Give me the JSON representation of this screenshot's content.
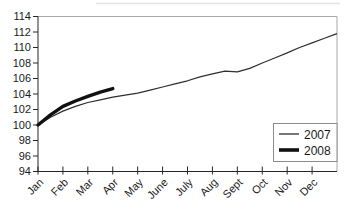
{
  "chart_data": {
    "type": "line",
    "title": "",
    "xlabel": "",
    "ylabel": "",
    "grid": false,
    "x_categories": [
      "Jan",
      "Feb",
      "Mar",
      "Apr",
      "May",
      "June",
      "July",
      "Aug",
      "Sept",
      "Oct",
      "Nov",
      "Dec"
    ],
    "y_tick_labels": [
      "114",
      "112",
      "110",
      "108",
      "106",
      "104",
      "102",
      "100",
      "98",
      "96",
      "94"
    ],
    "ylim": [
      94,
      114
    ],
    "ytick_step": 2,
    "legend_position": "bottom-right-inside",
    "series": [
      {
        "name": "2007",
        "line_style": "thin",
        "color": "#2e2e2e",
        "monthly_values": [
          100.0,
          101.8,
          102.9,
          103.6,
          104.1,
          104.9,
          105.7,
          106.6,
          106.9,
          108.0,
          109.3,
          110.6
        ],
        "year_end_value": 111.8,
        "samples": [
          [
            0,
            100.0
          ],
          [
            0.5,
            101.0
          ],
          [
            1,
            101.8
          ],
          [
            1.5,
            102.4
          ],
          [
            2,
            102.9
          ],
          [
            2.5,
            103.25
          ],
          [
            3,
            103.6
          ],
          [
            3.5,
            103.85
          ],
          [
            4,
            104.1
          ],
          [
            4.5,
            104.5
          ],
          [
            5,
            104.9
          ],
          [
            5.5,
            105.3
          ],
          [
            6,
            105.7
          ],
          [
            6.5,
            106.2
          ],
          [
            7,
            106.6
          ],
          [
            7.5,
            106.95
          ],
          [
            8,
            106.85
          ],
          [
            8.5,
            107.3
          ],
          [
            9,
            108.0
          ],
          [
            9.5,
            108.65
          ],
          [
            10,
            109.3
          ],
          [
            10.5,
            110.0
          ],
          [
            11,
            110.6
          ],
          [
            11.5,
            111.2
          ],
          [
            12,
            111.8
          ]
        ]
      },
      {
        "name": "2008",
        "line_style": "thick",
        "color": "#111111",
        "monthly_values": [
          100.0,
          102.4,
          103.7,
          104.7
        ],
        "samples": [
          [
            0,
            100.0
          ],
          [
            0.5,
            101.3
          ],
          [
            1,
            102.4
          ],
          [
            1.5,
            103.1
          ],
          [
            2,
            103.7
          ],
          [
            2.5,
            104.25
          ],
          [
            3,
            104.7
          ]
        ]
      }
    ]
  }
}
